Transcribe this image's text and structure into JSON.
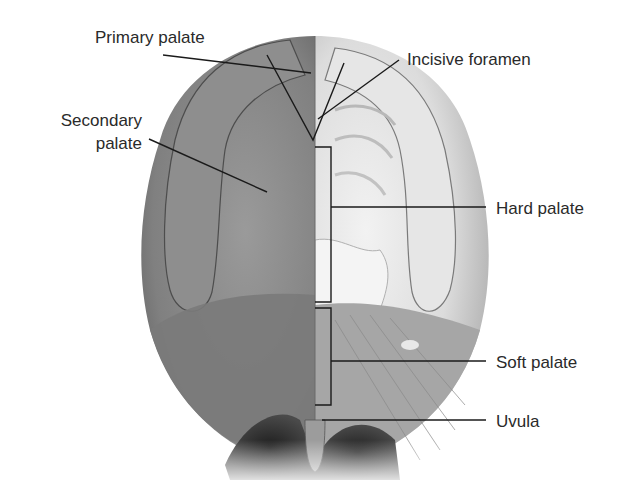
{
  "figure": {
    "labels": {
      "primary_palate": "Primary palate",
      "incisive_foramen": "Incisive foramen",
      "secondary_palate_line1": "Secondary",
      "secondary_palate_line2": "palate",
      "hard_palate": "Hard palate",
      "soft_palate": "Soft palate",
      "uvula": "Uvula"
    },
    "colors": {
      "background": "#ffffff",
      "text": "#2a2a2a",
      "leader_line": "#1a1a1a",
      "left_half_fill": "#8a8a8a",
      "right_half_fill": "#d8d8d8"
    }
  }
}
